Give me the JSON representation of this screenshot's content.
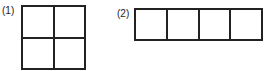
{
  "figures": [
    {
      "label": "(1)",
      "rows": 2,
      "cols": 2,
      "description": "2x2 grid of unit squares"
    },
    {
      "label": "(2)",
      "rows": 1,
      "cols": 4,
      "description": "1x4 row of unit squares"
    }
  ],
  "colors": {
    "line": "#222222",
    "background": "#ffffff"
  }
}
